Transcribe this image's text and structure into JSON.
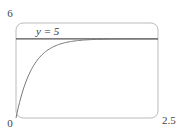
{
  "chart_data": {
    "type": "line",
    "title": "",
    "xlabel": "",
    "ylabel": "",
    "xlim": [
      0,
      2.5
    ],
    "ylim": [
      0,
      6
    ],
    "x_tick_labels": [
      "0",
      "2.5"
    ],
    "y_tick_labels": [
      "0",
      "6"
    ],
    "grid": false,
    "legend": null,
    "series": [
      {
        "name": "y = 5(1 - e^(-3.5t))",
        "x": [
          0,
          0.1,
          0.2,
          0.3,
          0.4,
          0.5,
          0.75,
          1.0,
          1.25,
          1.5,
          2.0,
          2.5
        ],
        "values": [
          0,
          1.48,
          2.52,
          3.25,
          3.77,
          4.13,
          4.64,
          4.85,
          4.94,
          4.97,
          5.0,
          5.0
        ]
      },
      {
        "name": "asymptote y = 5",
        "x": [
          0,
          2.5
        ],
        "values": [
          5,
          5
        ]
      }
    ],
    "annotations": [
      {
        "text": "y = 5",
        "x": 0.3,
        "y": 5.2
      }
    ]
  },
  "labels": {
    "y_max": "6",
    "origin": "0",
    "x_max": "2.5",
    "asymptote": "y = 5"
  }
}
